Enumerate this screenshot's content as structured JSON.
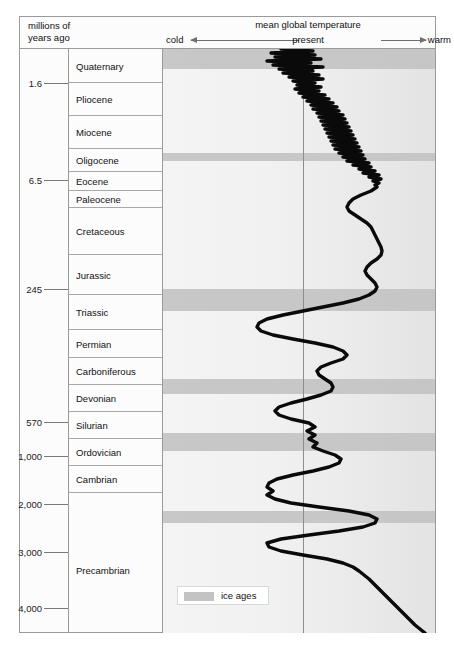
{
  "header": {
    "left_label_line1": "millions of",
    "left_label_line2": "years ago",
    "title": "mean global temperature",
    "cold_label": "cold",
    "warm_label": "warm",
    "present_label": "present"
  },
  "legend": {
    "label": "ice ages",
    "swatch_color": "#c3c3c3"
  },
  "axis_ticks": [
    {
      "label": "1.6",
      "y": 34
    },
    {
      "label": "6.5",
      "y": 131
    },
    {
      "label": "245",
      "y": 240
    },
    {
      "label": "570",
      "y": 373
    },
    {
      "label": "1,000",
      "y": 407
    },
    {
      "label": "2,000",
      "y": 455
    },
    {
      "label": "3,000",
      "y": 503
    },
    {
      "label": "4,000",
      "y": 559
    }
  ],
  "periods": [
    {
      "label": "Quaternary",
      "top": 0,
      "height": 34
    },
    {
      "label": "Pliocene",
      "top": 34,
      "height": 33
    },
    {
      "label": "Miocene",
      "top": 67,
      "height": 33
    },
    {
      "label": "Oligocene",
      "top": 100,
      "height": 23
    },
    {
      "label": "Eocene",
      "top": 123,
      "height": 19
    },
    {
      "label": "Paleocene",
      "top": 142,
      "height": 17
    },
    {
      "label": "Cretaceous",
      "top": 159,
      "height": 47
    },
    {
      "label": "Jurassic",
      "top": 206,
      "height": 40
    },
    {
      "label": "Triassic",
      "top": 246,
      "height": 35
    },
    {
      "label": "Permian",
      "top": 281,
      "height": 28
    },
    {
      "label": "Carboniferous",
      "top": 309,
      "height": 27
    },
    {
      "label": "Devonian",
      "top": 336,
      "height": 27
    },
    {
      "label": "Silurian",
      "top": 363,
      "height": 27
    },
    {
      "label": "Ordovician",
      "top": 390,
      "height": 27
    },
    {
      "label": "Cambrian",
      "top": 417,
      "height": 27
    },
    {
      "label": "Precambrian",
      "top": 444,
      "height": 140
    }
  ],
  "chart_data": {
    "type": "line",
    "title": "mean global temperature",
    "xlabel": "mean global temperature (cold ← present → warm)",
    "ylabel": "millions of years ago",
    "orientation": "vertical-time-axis",
    "grid": false,
    "legend": [
      "ice ages"
    ],
    "x_axis": {
      "left_label": "cold",
      "right_label": "warm",
      "reference_line": "present",
      "reference_x_px": 140,
      "plot_width_px": 272
    },
    "y_axis": {
      "unit": "millions of years ago",
      "direction": "top = present, bottom = 4,000 Mya",
      "tick_values": [
        1.6,
        6.5,
        245,
        570,
        1000,
        2000,
        3000,
        4000
      ]
    },
    "ice_ages": [
      {
        "name": "Quaternary glaciation",
        "y_top_px": 0,
        "y_height_px": 20
      },
      {
        "name": "Ordovician glaciation",
        "y_top_px": 104,
        "y_height_px": 8
      },
      {
        "name": "Permo-Carboniferous glaciation",
        "y_top_px": 240,
        "y_height_px": 22
      },
      {
        "name": "Late Ordovician glaciation",
        "y_top_px": 330,
        "y_height_px": 15
      },
      {
        "name": "Late Precambrian glaciation",
        "y_top_px": 384,
        "y_height_px": 18
      },
      {
        "name": "Huronian glaciation",
        "y_top_px": 462,
        "y_height_px": 12
      }
    ],
    "comment": "Temperature curve is drawn as a polyline of (x_px, y_px) points within the 272x584 plot; x increases toward 'warm'.",
    "curve_points": [
      [
        118,
        0
      ],
      [
        150,
        2
      ],
      [
        108,
        4
      ],
      [
        152,
        6
      ],
      [
        112,
        8
      ],
      [
        158,
        10
      ],
      [
        104,
        12
      ],
      [
        148,
        14
      ],
      [
        110,
        16
      ],
      [
        160,
        18
      ],
      [
        116,
        20
      ],
      [
        150,
        22
      ],
      [
        120,
        24
      ],
      [
        156,
        26
      ],
      [
        126,
        28
      ],
      [
        160,
        30
      ],
      [
        130,
        32
      ],
      [
        152,
        34
      ],
      [
        134,
        36
      ],
      [
        158,
        38
      ],
      [
        132,
        40
      ],
      [
        156,
        42
      ],
      [
        136,
        44
      ],
      [
        162,
        46
      ],
      [
        140,
        48
      ],
      [
        166,
        50
      ],
      [
        144,
        52
      ],
      [
        170,
        54
      ],
      [
        148,
        56
      ],
      [
        174,
        58
      ],
      [
        150,
        60
      ],
      [
        176,
        62
      ],
      [
        154,
        64
      ],
      [
        180,
        66
      ],
      [
        156,
        68
      ],
      [
        182,
        70
      ],
      [
        158,
        72
      ],
      [
        184,
        74
      ],
      [
        160,
        76
      ],
      [
        186,
        78
      ],
      [
        162,
        80
      ],
      [
        188,
        82
      ],
      [
        164,
        84
      ],
      [
        190,
        86
      ],
      [
        166,
        88
      ],
      [
        192,
        90
      ],
      [
        168,
        92
      ],
      [
        194,
        94
      ],
      [
        170,
        96
      ],
      [
        196,
        98
      ],
      [
        172,
        100
      ],
      [
        198,
        102
      ],
      [
        176,
        104
      ],
      [
        200,
        106
      ],
      [
        180,
        108
      ],
      [
        202,
        110
      ],
      [
        184,
        112
      ],
      [
        206,
        114
      ],
      [
        190,
        116
      ],
      [
        208,
        118
      ],
      [
        196,
        120
      ],
      [
        212,
        122
      ],
      [
        200,
        124
      ],
      [
        216,
        126
      ],
      [
        206,
        128
      ],
      [
        218,
        130
      ],
      [
        210,
        132
      ],
      [
        216,
        134
      ],
      [
        212,
        136
      ],
      [
        214,
        138
      ],
      [
        208,
        142
      ],
      [
        198,
        146
      ],
      [
        190,
        150
      ],
      [
        186,
        154
      ],
      [
        184,
        158
      ],
      [
        186,
        162
      ],
      [
        192,
        166
      ],
      [
        198,
        170
      ],
      [
        204,
        174
      ],
      [
        208,
        178
      ],
      [
        210,
        182
      ],
      [
        212,
        186
      ],
      [
        214,
        190
      ],
      [
        216,
        194
      ],
      [
        218,
        198
      ],
      [
        219,
        202
      ],
      [
        218,
        206
      ],
      [
        214,
        210
      ],
      [
        208,
        214
      ],
      [
        204,
        218
      ],
      [
        202,
        222
      ],
      [
        204,
        226
      ],
      [
        208,
        230
      ],
      [
        212,
        234
      ],
      [
        214,
        238
      ],
      [
        212,
        242
      ],
      [
        206,
        246
      ],
      [
        196,
        250
      ],
      [
        180,
        254
      ],
      [
        160,
        258
      ],
      [
        140,
        262
      ],
      [
        120,
        266
      ],
      [
        104,
        270
      ],
      [
        96,
        274
      ],
      [
        94,
        278
      ],
      [
        98,
        282
      ],
      [
        110,
        286
      ],
      [
        130,
        290
      ],
      [
        152,
        294
      ],
      [
        170,
        298
      ],
      [
        180,
        302
      ],
      [
        184,
        306
      ],
      [
        180,
        310
      ],
      [
        168,
        314
      ],
      [
        158,
        318
      ],
      [
        154,
        322
      ],
      [
        156,
        326
      ],
      [
        162,
        330
      ],
      [
        168,
        334
      ],
      [
        170,
        338
      ],
      [
        168,
        342
      ],
      [
        158,
        346
      ],
      [
        144,
        350
      ],
      [
        128,
        354
      ],
      [
        116,
        358
      ],
      [
        112,
        362
      ],
      [
        116,
        366
      ],
      [
        128,
        370
      ],
      [
        146,
        374
      ],
      [
        152,
        378
      ],
      [
        144,
        382
      ],
      [
        152,
        386
      ],
      [
        146,
        390
      ],
      [
        154,
        394
      ],
      [
        150,
        398
      ],
      [
        160,
        402
      ],
      [
        172,
        406
      ],
      [
        178,
        410
      ],
      [
        176,
        414
      ],
      [
        166,
        418
      ],
      [
        150,
        422
      ],
      [
        130,
        426
      ],
      [
        114,
        430
      ],
      [
        106,
        434
      ],
      [
        104,
        438
      ],
      [
        110,
        442
      ],
      [
        104,
        446
      ],
      [
        112,
        450
      ],
      [
        128,
        454
      ],
      [
        156,
        458
      ],
      [
        186,
        462
      ],
      [
        206,
        466
      ],
      [
        214,
        470
      ],
      [
        212,
        474
      ],
      [
        200,
        478
      ],
      [
        176,
        482
      ],
      [
        146,
        486
      ],
      [
        118,
        490
      ],
      [
        104,
        494
      ],
      [
        106,
        498
      ],
      [
        118,
        502
      ],
      [
        140,
        506
      ],
      [
        164,
        510
      ],
      [
        180,
        514
      ],
      [
        190,
        518
      ],
      [
        196,
        522
      ],
      [
        206,
        530
      ],
      [
        216,
        540
      ],
      [
        228,
        552
      ],
      [
        240,
        564
      ],
      [
        252,
        576
      ],
      [
        262,
        584
      ]
    ]
  }
}
